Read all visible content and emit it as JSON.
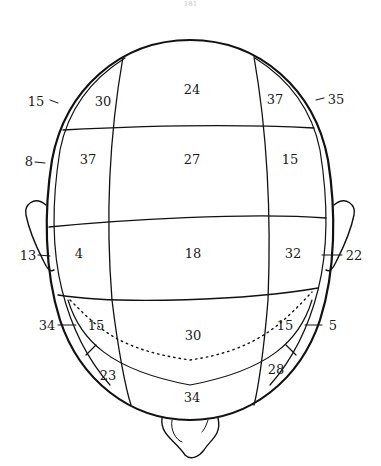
{
  "page": {
    "number": "181"
  },
  "figure": {
    "regions": {
      "front_left": "30",
      "front_center": "24",
      "front_right": "37",
      "upper_left": "37",
      "upper_center": "27",
      "upper_right": "15",
      "middle_left": "4",
      "middle_center": "18",
      "middle_right": "32",
      "lower_left": "15",
      "lower_center": "30",
      "lower_right": "15",
      "back_left": "23",
      "back_center": "34",
      "back_right": "28"
    },
    "rim_labels": {
      "front_left": "15",
      "front_right": "35",
      "upper_left": "8",
      "ear_left": "13",
      "ear_right": "22",
      "lower_left": "34",
      "lower_right": "5"
    }
  }
}
